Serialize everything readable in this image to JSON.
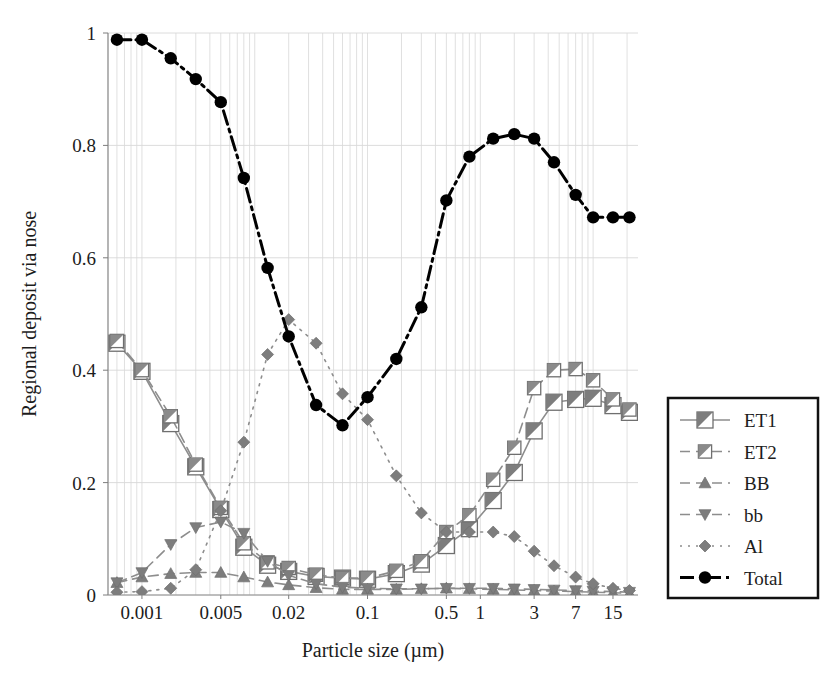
{
  "chart_data": {
    "type": "line",
    "title": "",
    "xlabel": "Particle size (µm)",
    "ylabel": "Regional deposit via nose",
    "xscale": "log",
    "xlim": [
      0.0005,
      25
    ],
    "ylim": [
      0,
      1
    ],
    "xtick_labels": [
      "0.001",
      "0.005",
      "0.02",
      "0.1",
      "0.5",
      "1",
      "3",
      "7",
      "15"
    ],
    "xtick_values": [
      0.001,
      0.005,
      0.02,
      0.1,
      0.5,
      1,
      3,
      7,
      15
    ],
    "ytick_labels": [
      "0",
      "0.2",
      "0.4",
      "0.6",
      "0.8",
      "1"
    ],
    "ytick_values": [
      0,
      0.2,
      0.4,
      0.6,
      0.8,
      1
    ],
    "grid": true,
    "legend_position": "right-outside",
    "x": [
      0.0006,
      0.001,
      0.0018,
      0.003,
      0.005,
      0.008,
      0.013,
      0.02,
      0.035,
      0.06,
      0.1,
      0.18,
      0.3,
      0.5,
      0.8,
      1.3,
      2,
      3,
      4.5,
      7,
      10,
      15,
      21
    ],
    "series": [
      {
        "name": "ET1",
        "marker": "square-half",
        "color": "#7d7d7d",
        "linestyle": "solid",
        "values": [
          0.448,
          0.398,
          0.305,
          0.228,
          0.152,
          0.085,
          0.053,
          0.042,
          0.033,
          0.03,
          0.028,
          0.038,
          0.055,
          0.088,
          0.118,
          0.168,
          0.218,
          0.292,
          0.343,
          0.348,
          0.35,
          0.337,
          0.325
        ]
      },
      {
        "name": "ET2",
        "marker": "square-half-small",
        "color": "#8a8a8a",
        "linestyle": "dashed",
        "values": [
          0.452,
          0.4,
          0.318,
          0.232,
          0.155,
          0.092,
          0.058,
          0.048,
          0.036,
          0.03,
          0.03,
          0.043,
          0.06,
          0.112,
          0.142,
          0.205,
          0.262,
          0.368,
          0.4,
          0.402,
          0.382,
          0.348,
          0.33
        ]
      },
      {
        "name": "BB",
        "marker": "triangle-up",
        "color": "#7d7d7d",
        "linestyle": "dashed",
        "values": [
          0.022,
          0.032,
          0.038,
          0.04,
          0.04,
          0.032,
          0.023,
          0.018,
          0.013,
          0.01,
          0.01,
          0.01,
          0.011,
          0.012,
          0.011,
          0.01,
          0.009,
          0.008,
          0.007,
          0.006,
          0.005,
          0.004,
          0.003
        ]
      },
      {
        "name": "bb",
        "marker": "triangle-down",
        "color": "#7d7d7d",
        "linestyle": "dashed",
        "values": [
          0.022,
          0.04,
          0.09,
          0.12,
          0.13,
          0.11,
          0.06,
          0.035,
          0.02,
          0.014,
          0.012,
          0.011,
          0.011,
          0.012,
          0.012,
          0.012,
          0.011,
          0.01,
          0.009,
          0.008,
          0.007,
          0.006,
          0.005
        ]
      },
      {
        "name": "Al",
        "marker": "diamond",
        "color": "#7d7d7d",
        "linestyle": "dotted",
        "values": [
          0.005,
          0.006,
          0.012,
          0.045,
          0.15,
          0.272,
          0.428,
          0.49,
          0.448,
          0.358,
          0.312,
          0.212,
          0.146,
          0.112,
          0.112,
          0.112,
          0.104,
          0.078,
          0.052,
          0.032,
          0.02,
          0.012,
          0.008
        ]
      },
      {
        "name": "Total",
        "marker": "circle",
        "color": "#000000",
        "linestyle": "dashdot",
        "values": [
          0.988,
          0.988,
          0.955,
          0.918,
          0.877,
          0.742,
          0.582,
          0.46,
          0.338,
          0.302,
          0.352,
          0.42,
          0.512,
          0.702,
          0.78,
          0.812,
          0.82,
          0.812,
          0.77,
          0.712,
          0.672,
          0.672,
          0.672
        ]
      }
    ]
  },
  "legend": {
    "entries": [
      {
        "label": "ET1"
      },
      {
        "label": "ET2"
      },
      {
        "label": "BB"
      },
      {
        "label": "bb"
      },
      {
        "label": "Al"
      },
      {
        "label": "Total"
      }
    ]
  },
  "colors": {
    "gray_marker": "#7d7d7d",
    "black": "#000000",
    "grid": "#d8d8d8",
    "axis": "#9a9a9a"
  }
}
